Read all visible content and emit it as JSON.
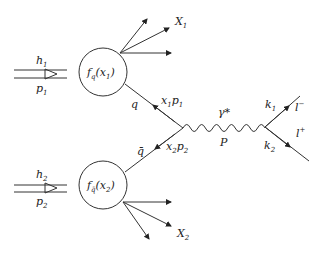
{
  "diagram": {
    "hadron1": {
      "label": "h",
      "sub": "1",
      "momentum": "p",
      "momentum_sub": "1"
    },
    "hadron2": {
      "label": "h",
      "sub": "2",
      "momentum": "p",
      "momentum_sub": "2"
    },
    "pdf1": {
      "f": "f",
      "fsub": "q",
      "arg": "(x",
      "argsub": "1",
      "close": ")"
    },
    "pdf2": {
      "f": "f",
      "fsub": "q̄",
      "arg": "(x",
      "argsub": "2",
      "close": ")"
    },
    "remnant1": {
      "label": "X",
      "sub": "1"
    },
    "remnant2": {
      "label": "X",
      "sub": "2"
    },
    "quark": {
      "label": "q",
      "momentum": "x",
      "momentum_sub": "1",
      "momentum_tail": "p",
      "momentum_tail_sub": "1"
    },
    "antiquark": {
      "label": "q̄",
      "momentum": "x",
      "momentum_sub": "2",
      "momentum_tail": "p",
      "momentum_tail_sub": "2"
    },
    "photon": {
      "label": "γ*",
      "momentum": "P"
    },
    "lepton_minus": {
      "label": "l",
      "sup": "−",
      "momentum": "k",
      "momentum_sub": "1"
    },
    "lepton_plus": {
      "label": "l",
      "sup": "+",
      "momentum": "k",
      "momentum_sub": "2"
    }
  }
}
